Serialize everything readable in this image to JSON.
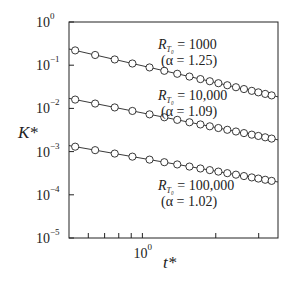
{
  "chart_data": {
    "type": "line",
    "title": "",
    "xlabel": "t*",
    "ylabel": "K*",
    "xscale": "log",
    "yscale": "log",
    "xlim": [
      0.5,
      3.6
    ],
    "ylim": [
      1e-05,
      1
    ],
    "grid": false,
    "legend": "none",
    "y_ticks": [
      {
        "value": 1,
        "label_base": "10",
        "label_exp": "0"
      },
      {
        "value": 0.1,
        "label_base": "10",
        "label_exp": "−1"
      },
      {
        "value": 0.01,
        "label_base": "10",
        "label_exp": "−2"
      },
      {
        "value": 0.001,
        "label_base": "10",
        "label_exp": "−3"
      },
      {
        "value": 0.0001,
        "label_base": "10",
        "label_exp": "−4"
      },
      {
        "value": 1e-05,
        "label_base": "10",
        "label_exp": "−5"
      }
    ],
    "x_ticks": [
      {
        "value": 0.6,
        "label": ""
      },
      {
        "value": 0.7,
        "label": ""
      },
      {
        "value": 0.8,
        "label": ""
      },
      {
        "value": 0.9,
        "label": ""
      },
      {
        "value": 1.0,
        "label_base": "10",
        "label_exp": "0"
      },
      {
        "value": 2.0,
        "label": ""
      },
      {
        "value": 3.0,
        "label": ""
      }
    ],
    "x": [
      0.53,
      0.64,
      0.77,
      0.91,
      1.07,
      1.23,
      1.39,
      1.56,
      1.73,
      1.89,
      2.05,
      2.23,
      2.42,
      2.61,
      2.81,
      2.99,
      3.19,
      3.39
    ],
    "series": [
      {
        "name": "R_T0 = 1000 (α = 1.25)",
        "annotation_line1": "= 1000",
        "annotation_line2": "(α = 1.25)",
        "fit_start": 0.22,
        "fit_end": 0.02,
        "exponent": -1.25
      },
      {
        "name": "R_T0 = 10,000 (α = 1.09)",
        "annotation_line1": "= 10,000",
        "annotation_line2": "(α = 1.09)",
        "fit_start": 0.016,
        "fit_end": 0.002,
        "exponent": -1.09
      },
      {
        "name": "R_T0 = 100,000 (α = 1.02)",
        "annotation_line1": "= 100,000",
        "annotation_line2": "(α = 1.02)",
        "fit_start": 0.0013,
        "fit_end": 0.00021,
        "exponent": -1.02
      }
    ],
    "marker": "open-circle",
    "line_color": "#222222"
  }
}
